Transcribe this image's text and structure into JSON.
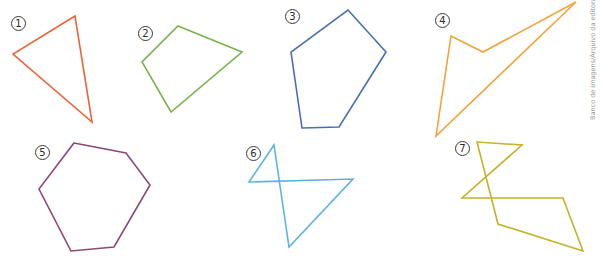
{
  "figures": [
    {
      "label": "1",
      "color": "#e8643a",
      "points": "75,16 13,54 92,122",
      "label_pos": [
        11,
        16
      ]
    },
    {
      "label": "2",
      "color": "#79b24a",
      "points": "178,26 242,52 171,112 142,62",
      "label_pos": [
        138,
        26
      ]
    },
    {
      "label": "3",
      "color": "#4a6fb0",
      "points": "348,10 386,52 339,127 302,128 291,52",
      "label_pos": [
        285,
        9
      ]
    },
    {
      "label": "4",
      "color": "#f2a33a",
      "points": "576,2 483,52 451,36 436,136",
      "label_pos": [
        435,
        13
      ]
    },
    {
      "label": "5",
      "color": "#8a4a78",
      "points": "74,143 126,153 150,185 114,247 71,251 39,189",
      "label_pos": [
        35,
        145
      ]
    },
    {
      "label": "6",
      "color": "#5ab4e0",
      "points": "274,145 289,247 353,179 249,182",
      "label_pos": [
        246,
        146
      ]
    },
    {
      "label": "7",
      "color": "#c4b22a",
      "points": "477,142 498,224 583,251 563,198 462,198 522,145",
      "label_pos": [
        455,
        141
      ]
    }
  ],
  "labels": {
    "l1": "1",
    "l2": "2",
    "l3": "3",
    "l4": "4",
    "l5": "5",
    "l6": "6",
    "l7": "7"
  },
  "credit": "Banco de imagens/Arquivo da editora"
}
